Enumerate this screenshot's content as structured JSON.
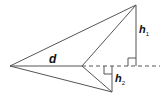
{
  "diagram": {
    "type": "geometry",
    "labels": {
      "diagonal": "d",
      "height1_main": "h",
      "height1_sub": "1",
      "height2_main": "h",
      "height2_sub": "2"
    },
    "points": {
      "left": [
        10,
        66
      ],
      "middle": [
        82,
        66
      ],
      "top": [
        136,
        5
      ],
      "bottom": [
        112,
        92
      ]
    },
    "colors": {
      "stroke": "#555555",
      "text": "#111111",
      "background": "#ffffff"
    }
  }
}
